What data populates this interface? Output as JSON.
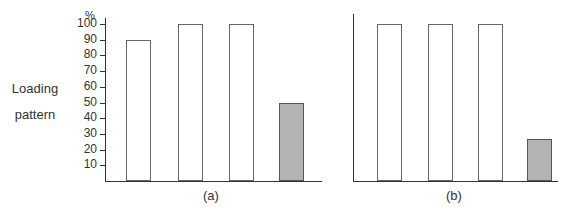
{
  "chart_data": [
    {
      "type": "bar",
      "panel_label": "(a)",
      "ylabel": "Loading pattern",
      "yunit": "%",
      "ylim": [
        0,
        100
      ],
      "yticks": [
        10,
        20,
        30,
        40,
        50,
        60,
        70,
        80,
        90,
        100
      ],
      "grid": false,
      "categories": [
        "1",
        "2",
        "3",
        "4"
      ],
      "values": [
        90,
        100,
        100,
        50
      ],
      "shaded": [
        false,
        false,
        false,
        true
      ]
    },
    {
      "type": "bar",
      "panel_label": "(b)",
      "ylim": [
        0,
        100
      ],
      "grid": false,
      "categories": [
        "1",
        "2",
        "3",
        "4"
      ],
      "values": [
        100,
        100,
        100,
        27
      ],
      "shaded": [
        false,
        false,
        false,
        true
      ]
    }
  ],
  "labels": {
    "ylabel_line1": "Loading",
    "ylabel_line2": "pattern",
    "unit": "%",
    "panel_a": "(a)",
    "panel_b": "(b)"
  },
  "colors": {
    "shaded_bar": "#b3b3b3",
    "axis": "#333333"
  }
}
